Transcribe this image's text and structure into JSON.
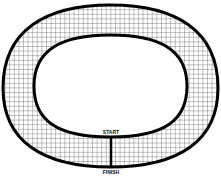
{
  "diagram": {
    "type": "race-track",
    "start_label": "START",
    "finish_label": "FINISH",
    "colors": {
      "track_border": "#000000",
      "grid": "#555555",
      "background": "#ffffff"
    }
  }
}
